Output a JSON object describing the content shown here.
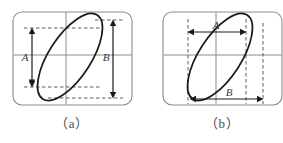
{
  "figure": {
    "background_color": "#ffffff",
    "panels": [
      {
        "id": "a",
        "caption": "（a）",
        "screen": {
          "x": 13,
          "y": 12,
          "width": 119,
          "height": 93,
          "corner_radius": 9,
          "border_color": "#8c8c8c",
          "grid_color": "#8c8c8c",
          "grid_vertical_x": [
            66
          ],
          "grid_horizontal_y": [
            55
          ]
        },
        "ellipse": {
          "center_x": 70,
          "center_y": 57,
          "semi_major": 50,
          "semi_minor": 21,
          "rotation_deg": -57,
          "stroke_color": "#1a1a1a",
          "stroke_width": 1.6
        },
        "measurements": [
          {
            "label": "A",
            "orientation": "vertical",
            "description": "inner vertical intercept on center axis",
            "arrow_x": 32,
            "from_y": 28,
            "to_y": 87,
            "label_x": 25,
            "label_y": 60
          },
          {
            "label": "B",
            "orientation": "vertical",
            "description": "full vertical extent of ellipse",
            "arrow_x": 113,
            "from_y": 20,
            "to_y": 98,
            "label_x": 106,
            "label_y": 60
          }
        ],
        "guides": [
          {
            "orientation": "horizontal",
            "y": 28,
            "x1": 24,
            "x2": 100
          },
          {
            "orientation": "horizontal",
            "y": 87,
            "x1": 24,
            "x2": 100
          },
          {
            "orientation": "horizontal",
            "y": 20,
            "x1": 96,
            "x2": 122
          },
          {
            "orientation": "horizontal",
            "y": 98,
            "x1": 50,
            "x2": 122
          }
        ]
      },
      {
        "id": "b",
        "caption": "（b）",
        "screen": {
          "x": 163,
          "y": 12,
          "width": 119,
          "height": 93,
          "corner_radius": 9,
          "border_color": "#8c8c8c",
          "grid_color": "#8c8c8c",
          "grid_vertical_x": [
            216
          ],
          "grid_horizontal_y": [
            55
          ]
        },
        "ellipse": {
          "center_x": 220,
          "center_y": 57,
          "semi_major": 50,
          "semi_minor": 21,
          "rotation_deg": -57,
          "stroke_color": "#1a1a1a",
          "stroke_width": 1.6
        },
        "measurements": [
          {
            "label": "A",
            "orientation": "horizontal",
            "description": "inner horizontal intercept on center axis",
            "arrow_y": 32,
            "from_x": 188,
            "to_x": 246,
            "label_x": 215,
            "label_y": 28
          },
          {
            "label": "B",
            "orientation": "horizontal",
            "description": "full horizontal extent of ellipse",
            "arrow_y": 99,
            "from_x": 190,
            "to_x": 263,
            "label_x": 228,
            "label_y": 95
          }
        ],
        "guides": [
          {
            "orientation": "vertical",
            "x": 188,
            "y1": 20,
            "y2": 104
          },
          {
            "orientation": "vertical",
            "x": 246,
            "y1": 20,
            "y2": 104
          },
          {
            "orientation": "vertical",
            "x": 263,
            "y1": 22,
            "y2": 104
          }
        ]
      }
    ],
    "colors": {
      "curve": "#1a1a1a",
      "grid": "#8c8c8c",
      "guide_dashed": "#5a5a5a",
      "arrow": "#1a1a1a",
      "caption_text": "#4a4a4a",
      "label_text": "#3a3a3a"
    }
  }
}
